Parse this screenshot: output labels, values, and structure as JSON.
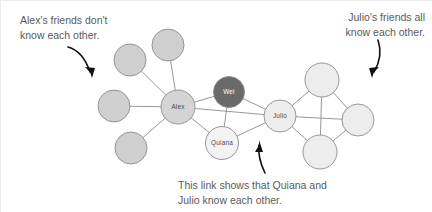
{
  "figure": {
    "width": 432,
    "height": 212,
    "background_color": "#ffffff",
    "type": "social-network-diagram"
  },
  "annotations": {
    "alex": {
      "line1": "Alex's friends don't",
      "line2": "know each other."
    },
    "julio": {
      "line1": "Julio's friends all",
      "line2": "know each other."
    },
    "link": {
      "line1": "This link shows that Quiana and",
      "line2": "Julio know each other."
    }
  },
  "colors": {
    "text": "#5a5a5a",
    "edge": "#8c8c8c",
    "node_stroke": "#8c8c8c",
    "arrow": "#111111",
    "fill_medium": "#cfcfcf",
    "fill_light": "#ededed",
    "fill_lighter": "#f3f3f3",
    "fill_dark": "#6a6a6a",
    "label_dark": "#4d4d4d",
    "label_on_dark": "#ffffff"
  },
  "graph": {
    "nodes": [
      {
        "id": "a1",
        "label": "",
        "cx": 168,
        "cy": 45,
        "r": 16,
        "fill": "#cfcfcf",
        "label_style": "light-node-label"
      },
      {
        "id": "a2",
        "label": "",
        "cx": 130,
        "cy": 60,
        "r": 16,
        "fill": "#cfcfcf",
        "label_style": "light-node-label"
      },
      {
        "id": "a3",
        "label": "",
        "cx": 114,
        "cy": 106,
        "r": 16,
        "fill": "#cfcfcf",
        "label_style": "light-node-label"
      },
      {
        "id": "a4",
        "label": "",
        "cx": 131,
        "cy": 148,
        "r": 16,
        "fill": "#cfcfcf",
        "label_style": "light-node-label"
      },
      {
        "id": "alex",
        "label": "Alex",
        "cx": 178,
        "cy": 107,
        "r": 17,
        "fill": "#d4d4d4",
        "label_style": "light-node-label"
      },
      {
        "id": "wei",
        "label": "Wei",
        "cx": 229,
        "cy": 92,
        "r": 15.5,
        "fill": "#6a6a6a",
        "label_style": "dark-node-label"
      },
      {
        "id": "quiana",
        "label": "Quiana",
        "cx": 222,
        "cy": 143,
        "r": 16.5,
        "fill": "#f3f3f3",
        "label_style": "light-node-label"
      },
      {
        "id": "julio",
        "label": "Julio",
        "cx": 280,
        "cy": 116,
        "r": 16,
        "fill": "#ededed",
        "label_style": "light-node-label"
      },
      {
        "id": "j1",
        "label": "",
        "cx": 322,
        "cy": 80,
        "r": 17,
        "fill": "#ededed",
        "label_style": "light-node-label"
      },
      {
        "id": "j2",
        "label": "",
        "cx": 358,
        "cy": 120,
        "r": 16,
        "fill": "#ededed",
        "label_style": "light-node-label"
      },
      {
        "id": "j3",
        "label": "",
        "cx": 320,
        "cy": 152,
        "r": 17,
        "fill": "#ededed",
        "label_style": "light-node-label"
      }
    ],
    "edges": [
      {
        "from": "alex",
        "to": "a1"
      },
      {
        "from": "alex",
        "to": "a2"
      },
      {
        "from": "alex",
        "to": "a3"
      },
      {
        "from": "alex",
        "to": "a4"
      },
      {
        "from": "alex",
        "to": "wei"
      },
      {
        "from": "alex",
        "to": "quiana"
      },
      {
        "from": "alex",
        "to": "julio"
      },
      {
        "from": "wei",
        "to": "quiana"
      },
      {
        "from": "wei",
        "to": "julio"
      },
      {
        "from": "quiana",
        "to": "julio"
      },
      {
        "from": "julio",
        "to": "j1"
      },
      {
        "from": "julio",
        "to": "j2"
      },
      {
        "from": "julio",
        "to": "j3"
      },
      {
        "from": "j1",
        "to": "j2"
      },
      {
        "from": "j1",
        "to": "j3"
      },
      {
        "from": "j2",
        "to": "j3"
      }
    ]
  },
  "arrows": [
    {
      "id": "arrow-alex",
      "path": "M 68 47 C 79 50 86 60 90 72",
      "head": "M 90 72 L 85 67 L 95 68 L 92 78 Z"
    },
    {
      "id": "arrow-julio",
      "path": "M 378 40 C 382 52 380 62 374 72",
      "head": "M 374 72 L 379 67 L 369 68 L 372 78 Z"
    },
    {
      "id": "arrow-link",
      "path": "M 265 173 C 260 163 258 155 259 145",
      "head": "M 259 145 L 255 152 L 263 152 L 259 140 Z"
    }
  ]
}
